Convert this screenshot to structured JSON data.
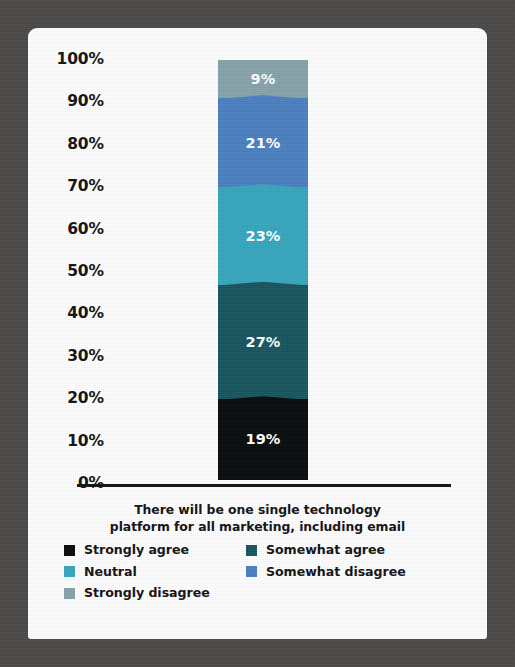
{
  "chart_data": {
    "type": "bar",
    "subtype": "stacked-bar-100-percent",
    "title": "There will be one single technology platform for all marketing, including email",
    "title_lines": [
      "There will be one single technology",
      "platform for all marketing, including email"
    ],
    "xlabel": "",
    "ylabel": "",
    "ylim": [
      0,
      100
    ],
    "grid": false,
    "legend_position": "bottom",
    "categories": [
      "There will be one single technology platform for all marketing, including email"
    ],
    "y_ticks": [
      "0%",
      "10%",
      "20%",
      "30%",
      "40%",
      "50%",
      "60%",
      "70%",
      "80%",
      "90%",
      "100%"
    ],
    "y_tick_values": [
      0,
      10,
      20,
      30,
      40,
      50,
      60,
      70,
      80,
      90,
      100
    ],
    "series": [
      {
        "name": "Strongly agree",
        "values": [
          19
        ],
        "label": "19%",
        "color": "#060a0a"
      },
      {
        "name": "Somewhat agree",
        "values": [
          27
        ],
        "label": "27%",
        "color": "#16545f"
      },
      {
        "name": "Neutral",
        "values": [
          23
        ],
        "label": "23%",
        "color": "#35a6bd"
      },
      {
        "name": "Somewhat disagree",
        "values": [
          21
        ],
        "label": "21%",
        "color": "#4a7fc1"
      },
      {
        "name": "Strongly disagree",
        "values": [
          9
        ],
        "label": "9%",
        "color": "#87a3ab"
      }
    ],
    "stack_order_bottom_to_top": [
      "Strongly agree",
      "Somewhat agree",
      "Neutral",
      "Somewhat disagree",
      "Strongly disagree"
    ],
    "stack_top_to_bottom": [
      {
        "name": "Strongly disagree",
        "value": 9,
        "label": "9%",
        "color": "#87a3ab"
      },
      {
        "name": "Somewhat disagree",
        "value": 21,
        "label": "21%",
        "color": "#4a7fc1"
      },
      {
        "name": "Neutral",
        "value": 23,
        "label": "23%",
        "color": "#35a6bd"
      },
      {
        "name": "Somewhat agree",
        "value": 27,
        "label": "27%",
        "color": "#16545f"
      },
      {
        "name": "Strongly agree",
        "value": 19,
        "label": "19%",
        "color": "#060a0a"
      }
    ],
    "legend": [
      {
        "name": "Strongly agree",
        "color": "#060a0a"
      },
      {
        "name": "Somewhat agree",
        "color": "#16545f"
      },
      {
        "name": "Neutral",
        "color": "#35a6bd"
      },
      {
        "name": "Somewhat disagree",
        "color": "#4a7fc1"
      },
      {
        "name": "Strongly disagree",
        "color": "#87a3ab"
      }
    ]
  },
  "frame": {
    "border_color": "#4a4846",
    "page_color": "#ffffff",
    "axis_color": "#111111"
  }
}
